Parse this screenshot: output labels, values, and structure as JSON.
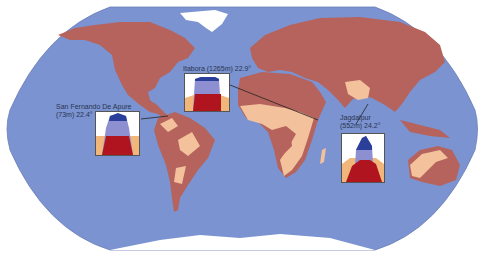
{
  "map": {
    "colors": {
      "ocean": "#7b93d1",
      "land_main": "#b5635c",
      "land_light": "#f3c19b",
      "ice": "#ffffff",
      "outline": "#3a3a6a"
    }
  },
  "stations": [
    {
      "name": "Itabora",
      "elevation": "(1265m)",
      "temp": "22.9°",
      "label": "Itabora (1265m) 22.9°"
    },
    {
      "name": "San Fernando De Apure",
      "elevation": "(73m)",
      "temp": "22.4°",
      "label_line1": "San Fernando De Apure",
      "label_line2": "(73m) 22.4°"
    },
    {
      "name": "Jagdalpur",
      "elevation": "(552m)",
      "temp": "24.2°",
      "label_line1": "Jagdalpur",
      "label_line2": "(552m) 24.2°"
    }
  ],
  "chart_colors": {
    "dark_blue": "#2a3f9a",
    "light_blue": "#8e8fd0",
    "red": "#b0141e",
    "orange": "#f1b77a",
    "white": "#ffffff"
  }
}
